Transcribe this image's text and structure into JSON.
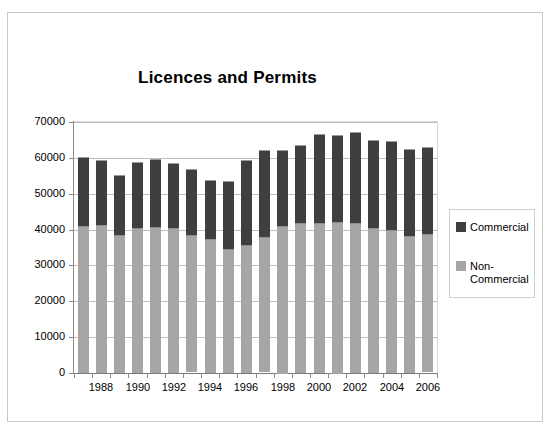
{
  "chart_data": {
    "type": "bar",
    "subtype": "stacked-column",
    "title": "Licences and Permits",
    "xlabel": "",
    "ylabel": "",
    "ylim": [
      0,
      70000
    ],
    "ytick_step": 10000,
    "yticks": [
      "70000",
      "60000",
      "50000",
      "40000",
      "30000",
      "20000",
      "10000",
      "0"
    ],
    "grid": true,
    "legend_position": "right",
    "categories": [
      1987,
      1988,
      1989,
      1990,
      1991,
      1992,
      1993,
      1994,
      1995,
      1996,
      1997,
      1998,
      1999,
      2000,
      2001,
      2002,
      2003,
      2004,
      2005,
      2006
    ],
    "xtick_labels": [
      "1988",
      "1990",
      "1992",
      "1994",
      "1996",
      "1998",
      "2000",
      "2002",
      "2004",
      "2006"
    ],
    "series": [
      {
        "name": "Non-Commercial",
        "color": "#a6a6a6",
        "values": [
          41000,
          41200,
          38500,
          40300,
          40600,
          40400,
          38300,
          37300,
          34500,
          35800,
          37700,
          41200,
          41800,
          41900,
          42300,
          41700,
          40300,
          39800,
          38200,
          38500
        ]
      },
      {
        "name": "Commercial",
        "color": "#3f3f3f",
        "values": [
          19300,
          18200,
          16700,
          18500,
          19100,
          18100,
          18500,
          16400,
          19000,
          23600,
          24400,
          21100,
          21800,
          24800,
          24200,
          25500,
          24600,
          24900,
          24200,
          24400
        ]
      }
    ],
    "totals": [
      60300,
      59400,
      55200,
      58800,
      59700,
      58500,
      56800,
      53700,
      53500,
      59400,
      62100,
      62300,
      63600,
      66700,
      66500,
      67200,
      64900,
      64700,
      62400,
      62900
    ]
  },
  "legend": {
    "entries": [
      {
        "label": "Commercial",
        "color": "#3f3f3f"
      },
      {
        "label": "Non-Commercial",
        "line1": "Non-",
        "line2": "Commercial",
        "color": "#a6a6a6"
      }
    ]
  }
}
